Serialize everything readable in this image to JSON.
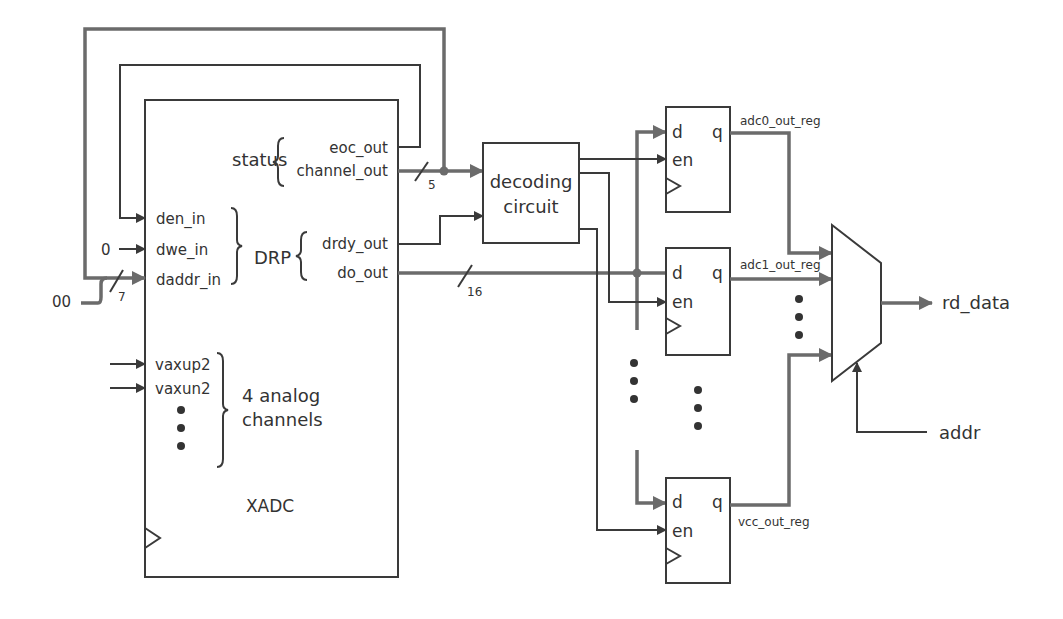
{
  "colors": {
    "wire": "#3a3a3a",
    "bus": "#6b6b6b",
    "text": "#333333"
  },
  "xadc": {
    "title": "XADC",
    "status_group": "status",
    "status_ports": [
      "eoc_out",
      "channel_out"
    ],
    "drp_group": "DRP",
    "drp_inputs": [
      "den_in",
      "dwe_in",
      "daddr_in"
    ],
    "drp_outputs": [
      "drdy_out",
      "do_out"
    ],
    "analog_ports": [
      "vaxup2",
      "vaxun2"
    ],
    "analog_group_line1": "4 analog",
    "analog_group_line2": "channels"
  },
  "inputs": {
    "dwe_const": "0",
    "daddr_const": "00"
  },
  "bus_widths": {
    "daddr": "7",
    "channel": "5",
    "do": "16"
  },
  "decoder": {
    "line1": "decoding",
    "line2": "circuit"
  },
  "registers": [
    {
      "name": "adc0_out_reg",
      "d": "d",
      "en": "en",
      "q": "q"
    },
    {
      "name": "adc1_out_reg",
      "d": "d",
      "en": "en",
      "q": "q"
    },
    {
      "name": "vcc_out_reg",
      "d": "d",
      "en": "en",
      "q": "q"
    }
  ],
  "mux": {
    "output": "rd_data",
    "select": "addr"
  }
}
